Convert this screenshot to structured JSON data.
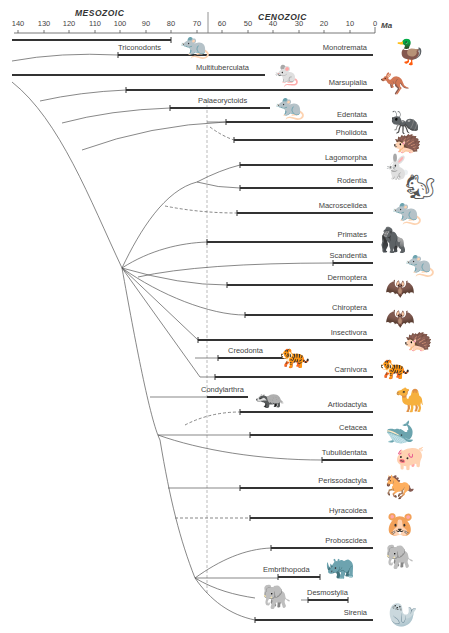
{
  "header": {
    "era_left": "MESOZOIC",
    "era_right": "CENOZOIC",
    "axis_unit": "Ma",
    "axis_ticks": [
      "140",
      "130",
      "120",
      "110",
      "100",
      "90",
      "80",
      "70",
      "60",
      "50",
      "40",
      "30",
      "20",
      "10",
      "0"
    ]
  },
  "taxa": {
    "triconodonts": "Triconodonts",
    "monotremata": "Monotremata",
    "multituberculata": "Multituberculata",
    "marsupialia": "Marsupialia",
    "palaeoryctoids": "Palaeoryctoids",
    "edentata": "Edentata",
    "pholidota": "Pholidota",
    "lagomorpha": "Lagomorpha",
    "rodentia": "Rodentia",
    "macroscelidea": "Macroscelidea",
    "primates": "Primates",
    "scandentia": "Scandentia",
    "dermoptera": "Dermoptera",
    "chiroptera": "Chiroptera",
    "insectivora": "Insectivora",
    "creodonta": "Creodonta",
    "carnivora": "Carnivora",
    "condylarthra": "Condylarthra",
    "artiodactyla": "Artiodactyla",
    "cetacea": "Cetacea",
    "tubulidentata": "Tubulidentata",
    "perissodactyla": "Perissodactyla",
    "hyracoidea": "Hyracoidea",
    "proboscidea": "Proboscidea",
    "embrithopoda": "Embrithopoda",
    "desmostylia": "Desmostylia",
    "sirenia": "Sirenia"
  },
  "animals": {
    "triconodont": "🐀",
    "platypus": "🦆",
    "multituberculate": "🐁",
    "kangaroo": "🦘",
    "palaeoryctoid": "🐀",
    "anteater": "🐜",
    "pangolin": "🦔",
    "rabbit": "🐇",
    "squirrel": "🐿",
    "elephant_shrew": "🐀",
    "gorilla": "🦍",
    "tree_shrew": "🐀",
    "colugo": "🦇",
    "bat": "🦇",
    "hedgehog": "🦔",
    "creodont": "🐅",
    "tiger": "🐅",
    "condylarth": "🦡",
    "camel": "🐪",
    "whale": "🐋",
    "aardvark": "🐖",
    "horse": "🐎",
    "hyrax": "🐹",
    "elephant": "🐘",
    "arsinoitherium": "🦏",
    "desmostylian": "🐘",
    "manatee": "🦭"
  },
  "colors": {
    "line": "#333333",
    "thin_line": "#555555",
    "boundary": "#aaaaaa"
  }
}
